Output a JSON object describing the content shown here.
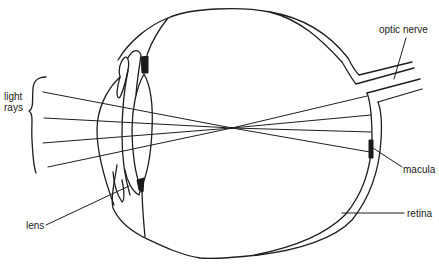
{
  "diagram": {
    "labels": {
      "light_rays_line1": "light",
      "light_rays_line2": "rays",
      "lens": "lens",
      "optic_nerve": "optic nerve",
      "macula": "macula",
      "retina": "retina"
    },
    "structures": [
      "cornea",
      "iris",
      "lens",
      "ciliary body",
      "eyeball wall",
      "retina",
      "macula",
      "optic nerve"
    ],
    "rays": {
      "count": 4,
      "focal_point": [
        232,
        128
      ]
    },
    "colors": {
      "line": "#1e1e1e",
      "background": "#ffffff"
    }
  }
}
